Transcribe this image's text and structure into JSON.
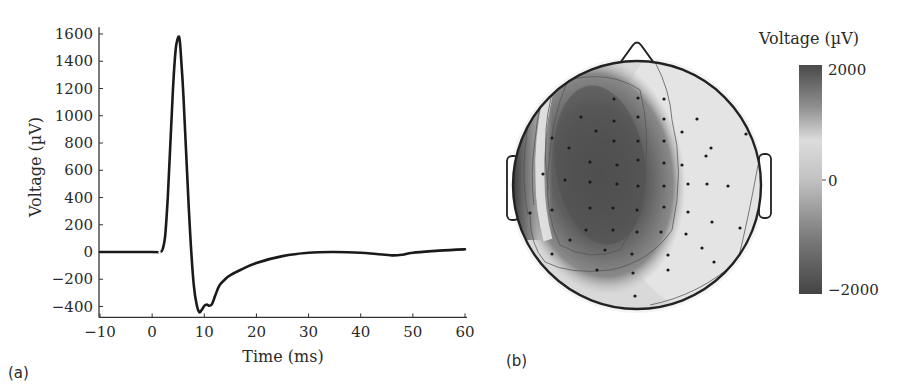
{
  "panel_a": {
    "label": "(a)",
    "xlabel": "Time (ms)",
    "ylabel": "Voltage (µV)"
  },
  "panel_b": {
    "label": "(b)",
    "colorbar_title": "Voltage (µV)",
    "colorbar_ticks": [
      "2000",
      "0",
      "−2000"
    ]
  },
  "chart_data": [
    {
      "type": "line",
      "title": "",
      "xlabel": "Time (ms)",
      "ylabel": "Voltage (µV)",
      "xlim": [
        -10,
        60
      ],
      "ylim": [
        -480,
        1650
      ],
      "xticks": [
        -10,
        0,
        10,
        20,
        30,
        40,
        50,
        60
      ],
      "xtick_labels": [
        "−10",
        "0",
        "10",
        "20",
        "30",
        "40",
        "50",
        "60"
      ],
      "yticks": [
        -400,
        -200,
        0,
        200,
        400,
        600,
        800,
        1000,
        1200,
        1400,
        1600
      ],
      "ytick_labels": [
        "−400",
        "−200",
        "0",
        "200",
        "400",
        "600",
        "800",
        "1000",
        "1200",
        "1400",
        "1600"
      ],
      "grid": false,
      "legend": null,
      "series": [
        {
          "name": "Voltage",
          "color": "#1a1a1a",
          "x": [
            -10,
            0,
            1.5,
            2,
            2.5,
            3,
            3.5,
            4,
            4.5,
            5,
            5.3,
            5.6,
            6,
            6.5,
            7,
            7.5,
            8,
            8.5,
            9,
            9.5,
            10,
            10.5,
            11,
            11.5,
            12,
            12.5,
            13,
            14,
            15,
            17,
            20,
            25,
            30,
            35,
            40,
            43,
            46,
            48,
            50,
            55,
            60
          ],
          "y": [
            0,
            0,
            0,
            20,
            120,
            400,
            800,
            1200,
            1480,
            1575,
            1550,
            1400,
            1150,
            750,
            350,
            0,
            -250,
            -380,
            -440,
            -425,
            -395,
            -385,
            -395,
            -380,
            -330,
            -280,
            -240,
            -200,
            -170,
            -130,
            -80,
            -30,
            -5,
            0,
            -5,
            -15,
            -25,
            -20,
            -5,
            10,
            20
          ]
        }
      ]
    },
    {
      "type": "heatmap",
      "title": "Scalp topography",
      "colorbar_label": "Voltage (µV)",
      "colorbar_range": [
        -2000,
        2000
      ],
      "colorbar_ticks": [
        2000,
        0,
        -2000
      ],
      "colormap": "gray (dark at ±2000, light at 0)",
      "description": "Top-down head map with nose and ears; dark region over left-frontal/central area, strong gradient at far-left edge, light region over right hemisphere; about 70 electrode dots with contour lines",
      "electrode_count": 72
    }
  ]
}
